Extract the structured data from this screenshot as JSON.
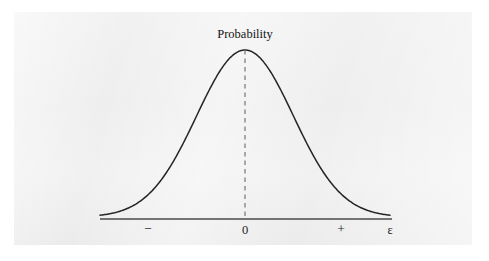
{
  "figure": {
    "kind": "probability-density-curve",
    "peak_label": "Probability",
    "panel_background": "#f1f1f1",
    "page_background": "#ffffff",
    "curve_color": "#252525",
    "axis_color": "#4a4a4a",
    "dashed_line_color": "#6a6a6a"
  },
  "chart_data": {
    "type": "line",
    "title": "",
    "subtitle": "",
    "xlabel": "ε",
    "ylabel": "",
    "grid": false,
    "legend": null,
    "series": [
      {
        "name": "Probability",
        "x": [
          -3.0,
          -2.8,
          -2.6,
          -2.4,
          -2.2,
          -2.0,
          -1.8,
          -1.6,
          -1.4,
          -1.2,
          -1.0,
          -0.8,
          -0.6,
          -0.4,
          -0.2,
          0.0,
          0.2,
          0.4,
          0.6,
          0.8,
          1.0,
          1.2,
          1.4,
          1.6,
          1.8,
          2.0,
          2.2,
          2.4,
          2.6,
          2.8,
          3.0
        ],
        "y": [
          0.011,
          0.02,
          0.034,
          0.056,
          0.089,
          0.135,
          0.198,
          0.278,
          0.375,
          0.487,
          0.607,
          0.726,
          0.835,
          0.923,
          0.98,
          1.0,
          0.98,
          0.923,
          0.835,
          0.726,
          0.607,
          0.487,
          0.375,
          0.278,
          0.198,
          0.135,
          0.089,
          0.056,
          0.034,
          0.02,
          0.011
        ]
      }
    ],
    "xlim": [
      -3.0,
      3.0
    ],
    "ylim": [
      0,
      1.06
    ],
    "annotations": [
      {
        "name": "peak-label",
        "text": "Probability",
        "x": 0.0,
        "y": 1.06
      },
      {
        "name": "mean-dashed-line",
        "text": "",
        "x": 0.0,
        "y": 1.0
      }
    ],
    "xticks": [
      {
        "value": -2.0,
        "label": "−"
      },
      {
        "value": 0.0,
        "label": "0"
      },
      {
        "value": 2.0,
        "label": "+"
      }
    ],
    "yticks": []
  },
  "axis": {
    "end_symbol": "ε",
    "ticks": [
      {
        "name": "tick-minus",
        "label": "−"
      },
      {
        "name": "tick-zero",
        "label": "0"
      },
      {
        "name": "tick-plus",
        "label": "+"
      }
    ]
  }
}
